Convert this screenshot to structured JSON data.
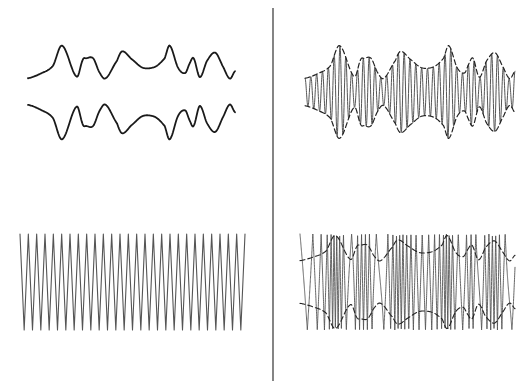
{
  "canvas": {
    "width": 526,
    "height": 381,
    "background": "#ffffff"
  },
  "colors": {
    "signal": "#1a1a1a",
    "carrier": "#555555",
    "envelope": "#222222",
    "divider": "#333333"
  },
  "divider": {
    "x": 273,
    "y1": 8,
    "y2": 381
  },
  "modulating_signal": {
    "description": "audio / modulating signal envelope, amplitude in [0,1] at x fraction of span",
    "keypoints": [
      [
        0.0,
        0.05
      ],
      [
        0.06,
        0.18
      ],
      [
        0.12,
        0.4
      ],
      [
        0.165,
        0.98
      ],
      [
        0.235,
        0.1
      ],
      [
        0.265,
        0.58
      ],
      [
        0.28,
        0.62
      ],
      [
        0.315,
        0.62
      ],
      [
        0.345,
        0.22
      ],
      [
        0.375,
        0.05
      ],
      [
        0.43,
        0.55
      ],
      [
        0.455,
        0.82
      ],
      [
        0.5,
        0.6
      ],
      [
        0.555,
        0.35
      ],
      [
        0.615,
        0.38
      ],
      [
        0.66,
        0.62
      ],
      [
        0.685,
        0.98
      ],
      [
        0.725,
        0.35
      ],
      [
        0.76,
        0.2
      ],
      [
        0.78,
        0.46
      ],
      [
        0.8,
        0.62
      ],
      [
        0.83,
        0.08
      ],
      [
        0.865,
        0.55
      ],
      [
        0.905,
        0.78
      ],
      [
        0.945,
        0.35
      ],
      [
        0.975,
        0.04
      ],
      [
        1.0,
        0.25
      ]
    ]
  },
  "panels": {
    "signal": {
      "label": "modulating-signal",
      "x1": 28,
      "x2": 235,
      "upper": {
        "base_y": 80,
        "peak_y": 45
      },
      "lower": {
        "base_y": 103,
        "peak_y": 140
      },
      "stroke_width": 1.8
    },
    "am": {
      "label": "amplitude-modulated-wave",
      "x1": 305,
      "x2": 515,
      "center_y": 92,
      "min_half": 12,
      "max_half": 47,
      "cycles": 36,
      "stroke_width": 1.0,
      "envelope_dash": "5,3"
    },
    "carrier": {
      "label": "unmodulated-carrier-wave",
      "x1": 20,
      "x2": 245,
      "top_y": 234,
      "bottom_y": 330,
      "cycles": 27,
      "stroke_width": 1.1
    },
    "fm": {
      "label": "frequency-modulated-wave",
      "x1": 300,
      "x2": 515,
      "top_y": 234,
      "bottom_y": 330,
      "base_cycles": 38,
      "deviation": 1.9,
      "stroke_width": 0.9,
      "envelope": {
        "center_y": 282,
        "min_half": 20,
        "max_half": 47
      },
      "envelope_dash": "5,3"
    }
  }
}
